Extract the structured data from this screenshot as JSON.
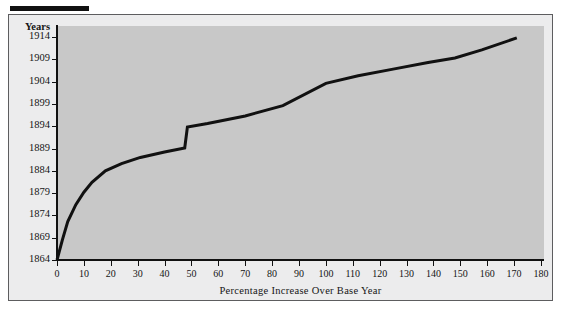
{
  "figure": {
    "x_axis_title": "Percentage Increase Over Base Year",
    "y_axis_title": "Years"
  },
  "chart_data": {
    "type": "line",
    "title": "",
    "subtitle": "",
    "xlabel": "Percentage Increase Over Base Year",
    "ylabel": "Years",
    "xlim": [
      0,
      180
    ],
    "ylim": [
      1864,
      1914
    ],
    "grid": false,
    "legend": null,
    "x_ticks": [
      0,
      10,
      20,
      30,
      40,
      50,
      60,
      70,
      80,
      90,
      100,
      110,
      120,
      130,
      140,
      150,
      160,
      170,
      180
    ],
    "y_ticks": [
      1864,
      1869,
      1874,
      1879,
      1884,
      1889,
      1894,
      1899,
      1904,
      1909,
      1914
    ],
    "x_tick_labels": [
      "0",
      "10",
      "20",
      "30",
      "40",
      "50",
      "60",
      "70",
      "80",
      "90",
      "100",
      "110",
      "120",
      "130",
      "140",
      "150",
      "160",
      "170",
      "180"
    ],
    "y_tick_labels": [
      "1864",
      "1869",
      "1874",
      "1879",
      "1884",
      "1889",
      "1894",
      "1899",
      "1904",
      "1909",
      "1914"
    ],
    "series": [
      {
        "name": "Cumulative percentage increase",
        "line_color": "#111111",
        "line_width": 3,
        "x": [
          0,
          2,
          4,
          7,
          10,
          13,
          18,
          24,
          31,
          40,
          47.5,
          48.5,
          56,
          70,
          84,
          100,
          112,
          125,
          138,
          148,
          158,
          171
        ],
        "y": [
          1864.0,
          1868.5,
          1872.6,
          1876.4,
          1879.2,
          1881.4,
          1884.0,
          1885.6,
          1887.0,
          1888.2,
          1889.1,
          1893.8,
          1894.6,
          1896.3,
          1898.6,
          1903.6,
          1905.3,
          1906.8,
          1908.3,
          1909.3,
          1911.1,
          1913.8
        ],
        "note": "Step discontinuity between 47.5% and 48.5% where the curve jumps from 1889 to 1894"
      }
    ]
  },
  "colors": {
    "plot_background": "#c8c8c8",
    "frame_background": "#ececed",
    "axis": "#111111",
    "line": "#111111",
    "text": "#151515"
  }
}
